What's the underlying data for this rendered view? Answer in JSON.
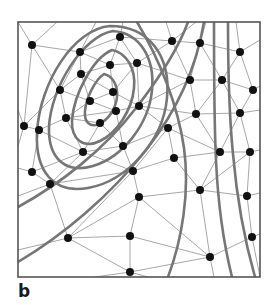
{
  "figure": {
    "panel_label": "b",
    "caption_label": "b",
    "colors": {
      "background": "#ffffff",
      "frame": "#555555",
      "mesh_line": "#8a8a8a",
      "contour_line": "#767676",
      "node": "#111111",
      "label": "#1a1a1a"
    },
    "frame": {
      "x": 18,
      "y": 22,
      "width": 242,
      "height": 255,
      "stroke_width": 1.6
    },
    "style": {
      "node_radius": 4.0,
      "mesh_stroke_width": 0.75,
      "contour_stroke_width": 2.6
    }
  },
  "chart_data": {
    "type": "scatter",
    "title": "",
    "xlabel": "",
    "ylabel": "",
    "xlim": [
      18,
      260
    ],
    "ylim": [
      22,
      277
    ],
    "grid": false,
    "legend": null,
    "annotations": [
      "b"
    ],
    "nodes": [
      [
        32,
        45
      ],
      [
        120,
        37
      ],
      [
        172,
        41
      ],
      [
        200,
        43
      ],
      [
        240,
        52
      ],
      [
        80,
        52
      ],
      [
        137,
        63
      ],
      [
        110,
        65
      ],
      [
        81,
        74
      ],
      [
        190,
        80
      ],
      [
        222,
        80
      ],
      [
        253,
        90
      ],
      [
        60,
        90
      ],
      [
        113,
        92
      ],
      [
        90,
        101
      ],
      [
        139,
        106
      ],
      [
        116,
        111
      ],
      [
        196,
        114
      ],
      [
        240,
        113
      ],
      [
        66,
        118
      ],
      [
        100,
        123
      ],
      [
        39,
        130
      ],
      [
        123,
        146
      ],
      [
        174,
        158
      ],
      [
        220,
        152
      ],
      [
        250,
        152
      ],
      [
        32,
        172
      ],
      [
        83,
        152
      ],
      [
        50,
        184
      ],
      [
        133,
        171
      ],
      [
        200,
        190
      ],
      [
        139,
        197
      ],
      [
        68,
        238
      ],
      [
        130,
        236
      ],
      [
        252,
        237
      ],
      [
        210,
        257
      ],
      [
        130,
        272
      ],
      [
        24,
        126
      ],
      [
        168,
        128
      ],
      [
        247,
        196
      ]
    ],
    "mesh_edges": [
      [
        [
          32,
          45
        ],
        [
          80,
          52
        ]
      ],
      [
        [
          32,
          45
        ],
        [
          60,
          90
        ]
      ],
      [
        [
          32,
          45
        ],
        [
          24,
          126
        ]
      ],
      [
        [
          32,
          45
        ],
        [
          18,
          22
        ]
      ],
      [
        [
          32,
          45
        ],
        [
          57,
          22
        ]
      ],
      [
        [
          80,
          52
        ],
        [
          120,
          37
        ]
      ],
      [
        [
          80,
          52
        ],
        [
          110,
          65
        ]
      ],
      [
        [
          80,
          52
        ],
        [
          81,
          74
        ]
      ],
      [
        [
          80,
          52
        ],
        [
          60,
          90
        ]
      ],
      [
        [
          80,
          52
        ],
        [
          96,
          22
        ]
      ],
      [
        [
          120,
          37
        ],
        [
          137,
          63
        ]
      ],
      [
        [
          120,
          37
        ],
        [
          110,
          65
        ]
      ],
      [
        [
          120,
          37
        ],
        [
          172,
          41
        ]
      ],
      [
        [
          120,
          37
        ],
        [
          123,
          22
        ]
      ],
      [
        [
          172,
          41
        ],
        [
          200,
          43
        ]
      ],
      [
        [
          172,
          41
        ],
        [
          137,
          63
        ]
      ],
      [
        [
          172,
          41
        ],
        [
          190,
          80
        ]
      ],
      [
        [
          172,
          41
        ],
        [
          166,
          22
        ]
      ],
      [
        [
          172,
          41
        ],
        [
          196,
          22
        ]
      ],
      [
        [
          200,
          43
        ],
        [
          240,
          52
        ]
      ],
      [
        [
          200,
          43
        ],
        [
          190,
          80
        ]
      ],
      [
        [
          200,
          43
        ],
        [
          222,
          80
        ]
      ],
      [
        [
          200,
          43
        ],
        [
          206,
          22
        ]
      ],
      [
        [
          240,
          52
        ],
        [
          222,
          80
        ]
      ],
      [
        [
          240,
          52
        ],
        [
          253,
          90
        ]
      ],
      [
        [
          240,
          52
        ],
        [
          260,
          40
        ]
      ],
      [
        [
          240,
          52
        ],
        [
          236,
          22
        ]
      ],
      [
        [
          137,
          63
        ],
        [
          110,
          65
        ]
      ],
      [
        [
          137,
          63
        ],
        [
          113,
          92
        ]
      ],
      [
        [
          137,
          63
        ],
        [
          139,
          106
        ]
      ],
      [
        [
          137,
          63
        ],
        [
          190,
          80
        ]
      ],
      [
        [
          110,
          65
        ],
        [
          81,
          74
        ]
      ],
      [
        [
          110,
          65
        ],
        [
          113,
          92
        ]
      ],
      [
        [
          81,
          74
        ],
        [
          60,
          90
        ]
      ],
      [
        [
          81,
          74
        ],
        [
          90,
          101
        ]
      ],
      [
        [
          81,
          74
        ],
        [
          113,
          92
        ]
      ],
      [
        [
          190,
          80
        ],
        [
          222,
          80
        ]
      ],
      [
        [
          190,
          80
        ],
        [
          196,
          114
        ]
      ],
      [
        [
          190,
          80
        ],
        [
          139,
          106
        ]
      ],
      [
        [
          222,
          80
        ],
        [
          253,
          90
        ]
      ],
      [
        [
          222,
          80
        ],
        [
          196,
          114
        ]
      ],
      [
        [
          222,
          80
        ],
        [
          240,
          113
        ]
      ],
      [
        [
          253,
          90
        ],
        [
          240,
          113
        ]
      ],
      [
        [
          253,
          90
        ],
        [
          260,
          86
        ]
      ],
      [
        [
          60,
          90
        ],
        [
          90,
          101
        ]
      ],
      [
        [
          60,
          90
        ],
        [
          66,
          118
        ]
      ],
      [
        [
          60,
          90
        ],
        [
          24,
          126
        ]
      ],
      [
        [
          113,
          92
        ],
        [
          90,
          101
        ]
      ],
      [
        [
          113,
          92
        ],
        [
          116,
          111
        ]
      ],
      [
        [
          113,
          92
        ],
        [
          139,
          106
        ]
      ],
      [
        [
          90,
          101
        ],
        [
          116,
          111
        ]
      ],
      [
        [
          90,
          101
        ],
        [
          66,
          118
        ]
      ],
      [
        [
          139,
          106
        ],
        [
          116,
          111
        ]
      ],
      [
        [
          139,
          106
        ],
        [
          168,
          128
        ]
      ],
      [
        [
          139,
          106
        ],
        [
          196,
          114
        ]
      ],
      [
        [
          116,
          111
        ],
        [
          100,
          123
        ]
      ],
      [
        [
          116,
          111
        ],
        [
          123,
          146
        ]
      ],
      [
        [
          116,
          111
        ],
        [
          66,
          118
        ]
      ],
      [
        [
          196,
          114
        ],
        [
          240,
          113
        ]
      ],
      [
        [
          196,
          114
        ],
        [
          168,
          128
        ]
      ],
      [
        [
          196,
          114
        ],
        [
          220,
          152
        ]
      ],
      [
        [
          240,
          113
        ],
        [
          250,
          152
        ]
      ],
      [
        [
          240,
          113
        ],
        [
          260,
          110
        ]
      ],
      [
        [
          240,
          113
        ],
        [
          220,
          152
        ]
      ],
      [
        [
          66,
          118
        ],
        [
          100,
          123
        ]
      ],
      [
        [
          66,
          118
        ],
        [
          39,
          130
        ]
      ],
      [
        [
          66,
          118
        ],
        [
          83,
          152
        ]
      ],
      [
        [
          100,
          123
        ],
        [
          123,
          146
        ]
      ],
      [
        [
          100,
          123
        ],
        [
          83,
          152
        ]
      ],
      [
        [
          39,
          130
        ],
        [
          24,
          126
        ]
      ],
      [
        [
          39,
          130
        ],
        [
          32,
          172
        ]
      ],
      [
        [
          39,
          130
        ],
        [
          83,
          152
        ]
      ],
      [
        [
          123,
          146
        ],
        [
          83,
          152
        ]
      ],
      [
        [
          123,
          146
        ],
        [
          133,
          171
        ]
      ],
      [
        [
          123,
          146
        ],
        [
          168,
          128
        ]
      ],
      [
        [
          168,
          128
        ],
        [
          174,
          158
        ]
      ],
      [
        [
          168,
          128
        ],
        [
          133,
          171
        ]
      ],
      [
        [
          168,
          128
        ],
        [
          220,
          152
        ]
      ],
      [
        [
          174,
          158
        ],
        [
          220,
          152
        ]
      ],
      [
        [
          174,
          158
        ],
        [
          200,
          190
        ]
      ],
      [
        [
          174,
          158
        ],
        [
          133,
          171
        ]
      ],
      [
        [
          220,
          152
        ],
        [
          250,
          152
        ]
      ],
      [
        [
          220,
          152
        ],
        [
          200,
          190
        ]
      ],
      [
        [
          250,
          152
        ],
        [
          247,
          196
        ]
      ],
      [
        [
          250,
          152
        ],
        [
          260,
          150
        ]
      ],
      [
        [
          250,
          152
        ],
        [
          200,
          190
        ]
      ],
      [
        [
          32,
          172
        ],
        [
          50,
          184
        ]
      ],
      [
        [
          32,
          172
        ],
        [
          83,
          152
        ]
      ],
      [
        [
          32,
          172
        ],
        [
          18,
          168
        ]
      ],
      [
        [
          83,
          152
        ],
        [
          50,
          184
        ]
      ],
      [
        [
          83,
          152
        ],
        [
          133,
          171
        ]
      ],
      [
        [
          50,
          184
        ],
        [
          68,
          238
        ]
      ],
      [
        [
          50,
          184
        ],
        [
          133,
          171
        ]
      ],
      [
        [
          50,
          184
        ],
        [
          18,
          196
        ]
      ],
      [
        [
          133,
          171
        ],
        [
          139,
          197
        ]
      ],
      [
        [
          133,
          171
        ],
        [
          68,
          238
        ]
      ],
      [
        [
          200,
          190
        ],
        [
          139,
          197
        ]
      ],
      [
        [
          200,
          190
        ],
        [
          247,
          196
        ]
      ],
      [
        [
          200,
          190
        ],
        [
          210,
          257
        ]
      ],
      [
        [
          139,
          197
        ],
        [
          68,
          238
        ]
      ],
      [
        [
          139,
          197
        ],
        [
          130,
          236
        ]
      ],
      [
        [
          139,
          197
        ],
        [
          210,
          257
        ]
      ],
      [
        [
          247,
          196
        ],
        [
          252,
          237
        ]
      ],
      [
        [
          247,
          196
        ],
        [
          260,
          193
        ]
      ],
      [
        [
          68,
          238
        ],
        [
          130,
          236
        ]
      ],
      [
        [
          68,
          238
        ],
        [
          130,
          272
        ]
      ],
      [
        [
          68,
          238
        ],
        [
          18,
          250
        ]
      ],
      [
        [
          130,
          236
        ],
        [
          130,
          272
        ]
      ],
      [
        [
          130,
          236
        ],
        [
          210,
          257
        ]
      ],
      [
        [
          252,
          237
        ],
        [
          210,
          257
        ]
      ],
      [
        [
          252,
          237
        ],
        [
          260,
          234
        ]
      ],
      [
        [
          252,
          237
        ],
        [
          260,
          277
        ]
      ],
      [
        [
          210,
          257
        ],
        [
          130,
          272
        ]
      ],
      [
        [
          210,
          257
        ],
        [
          214,
          277
        ]
      ],
      [
        [
          130,
          272
        ],
        [
          95,
          277
        ]
      ],
      [
        [
          130,
          272
        ],
        [
          148,
          277
        ]
      ],
      [
        [
          24,
          126
        ],
        [
          18,
          110
        ]
      ],
      [
        [
          24,
          126
        ],
        [
          18,
          146
        ]
      ]
    ],
    "contours": [
      {
        "id": "contour-inner-1",
        "closed": true,
        "path": "M 104,74 C 113,76 118,86 117,97 C 116,109 108,120 99,124 C 90,128 84,122 85,111 C 86,98 95,80 104,74 Z"
      },
      {
        "id": "contour-inner-2",
        "closed": true,
        "path": "M 112,50 C 127,53 136,69 134,88 C 132,110 117,133 100,141 C 84,149 71,140 72,120 C 74,94 93,58 112,50 Z"
      },
      {
        "id": "contour-mid-3",
        "closed": true,
        "path": "M 113,31 C 140,33 155,58 152,90 C 149,124 123,157 93,166 C 66,174 48,159 49,127 C 51,87 83,36 113,31 Z"
      },
      {
        "id": "contour-outer-4",
        "closed": true,
        "path": "M 110,26 C 149,26 171,56 167,98 C 163,141 127,181 88,188 C 54,194 35,172 37,132 C 40,82 74,29 110,26 Z"
      },
      {
        "id": "contour-sweep-5",
        "closed": false,
        "path": "M 137,22 C 160,60 178,106 184,148 C 190,192 182,240 168,277"
      },
      {
        "id": "contour-sweep-6",
        "closed": false,
        "path": "M 18,207 C 60,184 104,150 136,108 C 164,72 180,44 188,22"
      },
      {
        "id": "contour-sweep-7",
        "closed": false,
        "path": "M 18,262 C 62,236 110,196 146,150 C 176,112 196,70 204,22"
      },
      {
        "id": "contour-vert-8",
        "closed": false,
        "path": "M 214,22 C 214,70 214,120 216,160 C 218,205 224,245 232,277"
      },
      {
        "id": "contour-vert-9",
        "closed": false,
        "path": "M 228,22 C 228,68 229,114 233,154 C 237,200 245,242 255,277"
      }
    ]
  }
}
